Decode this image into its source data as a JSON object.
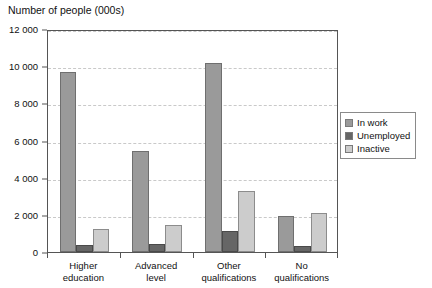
{
  "chart_data": {
    "type": "bar",
    "title": "Number of people (000s)",
    "xlabel": "",
    "ylabel": "",
    "ylim": [
      0,
      12000
    ],
    "ytick_labels": [
      "0",
      "2 000",
      "4 000",
      "6 000",
      "8 000",
      "10 000",
      "12 000"
    ],
    "ytick_values": [
      0,
      2000,
      4000,
      6000,
      8000,
      10000,
      12000
    ],
    "grid": true,
    "grid_orientation": "horizontal",
    "legend_position": "right",
    "categories": [
      "Higher education",
      "Advanced level",
      "Other qualifications",
      "No qualifications"
    ],
    "category_lines": [
      [
        "Higher",
        "education"
      ],
      [
        "Advanced",
        "level"
      ],
      [
        "Other",
        "qualifications"
      ],
      [
        "No",
        "qualifications"
      ]
    ],
    "series": [
      {
        "name": "In work",
        "color": "#9a9a9a",
        "values": [
          9700,
          5450,
          10150,
          1950
        ]
      },
      {
        "name": "Unemployed",
        "color": "#666666",
        "values": [
          400,
          450,
          1150,
          300
        ]
      },
      {
        "name": "Inactive",
        "color": "#cccccc",
        "values": [
          1250,
          1450,
          3300,
          2100
        ]
      }
    ]
  }
}
